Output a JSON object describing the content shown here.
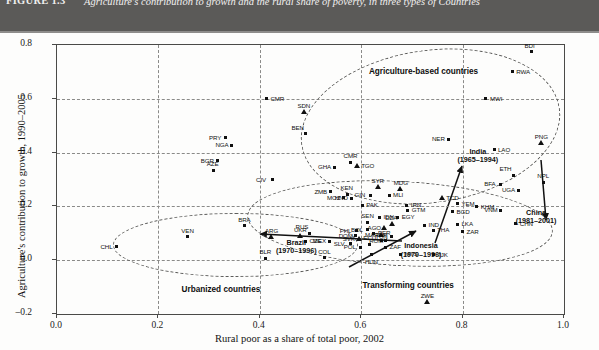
{
  "figure": {
    "number": "FIGURE 1.3",
    "caption": "Agriculture's contribution to growth and the rural share of poverty, in three types of Countries"
  },
  "chart_data": {
    "type": "scatter",
    "title": "Agriculture's contribution to growth and the rural share of poverty, in three types of Countries",
    "xlabel": "Rural poor as a share of total poor, 2002",
    "ylabel": "Agriculture's contribution to growth, 1990–2005",
    "xlim": [
      0.0,
      1.0
    ],
    "ylim": [
      -0.2,
      0.8
    ],
    "xticks": [
      "0.0",
      "0.2",
      "0.4",
      "0.6",
      "0.8",
      "1.0"
    ],
    "yticks": [
      "0.8",
      "0.6",
      "0.4",
      "0.2",
      "0.0",
      "–0.2"
    ],
    "grid": "dashed",
    "legend": "none",
    "points": [
      {
        "label": "BDI",
        "x": 0.935,
        "y": 0.775,
        "marker": "square",
        "lpos": "top"
      },
      {
        "label": "RWA",
        "x": 0.898,
        "y": 0.7,
        "marker": "square",
        "lpos": "right"
      },
      {
        "label": "MWI",
        "x": 0.846,
        "y": 0.6,
        "marker": "square",
        "lpos": "right"
      },
      {
        "label": "CMR",
        "x": 0.413,
        "y": 0.6,
        "marker": "square",
        "lpos": "right"
      },
      {
        "label": "SDN",
        "x": 0.487,
        "y": 0.552,
        "marker": "triangle",
        "lpos": "top"
      },
      {
        "label": "BEN",
        "x": 0.49,
        "y": 0.47,
        "marker": "square",
        "lpos": "topleft"
      },
      {
        "label": "PRY",
        "x": 0.332,
        "y": 0.455,
        "marker": "square",
        "lpos": "left"
      },
      {
        "label": "NGA",
        "x": 0.345,
        "y": 0.428,
        "marker": "square",
        "lpos": "left"
      },
      {
        "label": "NER",
        "x": 0.772,
        "y": 0.45,
        "marker": "square",
        "lpos": "left"
      },
      {
        "label": "PNG",
        "x": 0.955,
        "y": 0.437,
        "marker": "triangle",
        "lpos": "top"
      },
      {
        "label": "LAO",
        "x": 0.862,
        "y": 0.41,
        "marker": "square",
        "lpos": "right"
      },
      {
        "label": "CMR",
        "x": 0.578,
        "y": 0.365,
        "marker": "square",
        "lpos": "top"
      },
      {
        "label": "TGO",
        "x": 0.592,
        "y": 0.35,
        "marker": "triangle",
        "lpos": "right"
      },
      {
        "label": "GHA",
        "x": 0.547,
        "y": 0.345,
        "marker": "square",
        "lpos": "left"
      },
      {
        "label": "BGR",
        "x": 0.316,
        "y": 0.37,
        "marker": "square",
        "lpos": "left"
      },
      {
        "label": "AZE",
        "x": 0.308,
        "y": 0.335,
        "marker": "square",
        "lpos": "top"
      },
      {
        "label": "CIV",
        "x": 0.425,
        "y": 0.3,
        "marker": "square",
        "lpos": "left"
      },
      {
        "label": "ETH",
        "x": 0.9,
        "y": 0.315,
        "marker": "square",
        "lpos": "topleft"
      },
      {
        "label": "NPL",
        "x": 0.96,
        "y": 0.29,
        "marker": "square",
        "lpos": "top"
      },
      {
        "label": "BFA",
        "x": 0.875,
        "y": 0.283,
        "marker": "square",
        "lpos": "left"
      },
      {
        "label": "UGA",
        "x": 0.91,
        "y": 0.26,
        "marker": "square",
        "lpos": "left"
      },
      {
        "label": "SYR",
        "x": 0.633,
        "y": 0.272,
        "marker": "triangle",
        "lpos": "top"
      },
      {
        "label": "MDG",
        "x": 0.677,
        "y": 0.263,
        "marker": "triangle",
        "lpos": "top"
      },
      {
        "label": "ZMB",
        "x": 0.54,
        "y": 0.255,
        "marker": "square",
        "lpos": "left"
      },
      {
        "label": "KEN",
        "x": 0.572,
        "y": 0.245,
        "marker": "square",
        "lpos": "top"
      },
      {
        "label": "MOZ",
        "x": 0.565,
        "y": 0.233,
        "marker": "square",
        "lpos": "left"
      },
      {
        "label": "GIN",
        "x": 0.619,
        "y": 0.242,
        "marker": "square",
        "lpos": "left"
      },
      {
        "label": "MLI",
        "x": 0.655,
        "y": 0.242,
        "marker": "square",
        "lpos": "right"
      },
      {
        "label": "TCD",
        "x": 0.76,
        "y": 0.232,
        "marker": "triangle",
        "lpos": "right"
      },
      {
        "label": "YEM",
        "x": 0.79,
        "y": 0.21,
        "marker": "square",
        "lpos": "right"
      },
      {
        "label": "KHM",
        "x": 0.828,
        "y": 0.198,
        "marker": "square",
        "lpos": "right"
      },
      {
        "label": "VNM",
        "x": 0.875,
        "y": 0.185,
        "marker": "square",
        "lpos": "left"
      },
      {
        "label": "CHN",
        "x": 0.905,
        "y": 0.135,
        "marker": "square",
        "lpos": "right"
      },
      {
        "label": "BGD",
        "x": 0.78,
        "y": 0.18,
        "marker": "square",
        "lpos": "right"
      },
      {
        "label": "LKA",
        "x": 0.79,
        "y": 0.133,
        "marker": "square",
        "lpos": "right"
      },
      {
        "label": "ZAR",
        "x": 0.8,
        "y": 0.105,
        "marker": "square",
        "lpos": "right"
      },
      {
        "label": "PAK",
        "x": 0.602,
        "y": 0.205,
        "marker": "square",
        "lpos": "right"
      },
      {
        "label": "IRN",
        "x": 0.69,
        "y": 0.205,
        "marker": "square",
        "lpos": "right"
      },
      {
        "label": "HND",
        "x": 0.58,
        "y": 0.23,
        "marker": "square",
        "lpos": "left"
      },
      {
        "label": "GTM",
        "x": 0.692,
        "y": 0.185,
        "marker": "square",
        "lpos": "right"
      },
      {
        "label": "IDN",
        "x": 0.636,
        "y": 0.16,
        "marker": "square",
        "lpos": "right"
      },
      {
        "label": "EGY",
        "x": 0.672,
        "y": 0.16,
        "marker": "square",
        "lpos": "right"
      },
      {
        "label": "IND",
        "x": 0.725,
        "y": 0.13,
        "marker": "square",
        "lpos": "right"
      },
      {
        "label": "THA",
        "x": 0.742,
        "y": 0.112,
        "marker": "square",
        "lpos": "right"
      },
      {
        "label": "SEN",
        "x": 0.613,
        "y": 0.142,
        "marker": "square",
        "lpos": "top"
      },
      {
        "label": "DZA",
        "x": 0.66,
        "y": 0.133,
        "marker": "triangle",
        "lpos": "top"
      },
      {
        "label": "AGO",
        "x": 0.645,
        "y": 0.118,
        "marker": "triangle",
        "lpos": "left"
      },
      {
        "label": "MAR",
        "x": 0.64,
        "y": 0.093,
        "marker": "triangle",
        "lpos": "left"
      },
      {
        "label": "TUN",
        "x": 0.66,
        "y": 0.088,
        "marker": "square",
        "lpos": "left"
      },
      {
        "label": "ROM",
        "x": 0.648,
        "y": 0.073,
        "marker": "square",
        "lpos": "left"
      },
      {
        "label": "TJK",
        "x": 0.742,
        "y": 0.02,
        "marker": "square",
        "lpos": "right"
      },
      {
        "label": "ZWE",
        "x": 0.73,
        "y": -0.155,
        "marker": "triangle",
        "lpos": "top"
      },
      {
        "label": "BRA",
        "x": 0.37,
        "y": 0.128,
        "marker": "square",
        "lpos": "top"
      },
      {
        "label": "VEN",
        "x": 0.258,
        "y": 0.088,
        "marker": "square",
        "lpos": "top"
      },
      {
        "label": "CHL",
        "x": 0.118,
        "y": 0.05,
        "marker": "square",
        "lpos": "left"
      },
      {
        "label": "ARG",
        "x": 0.423,
        "y": 0.085,
        "marker": "triangle",
        "lpos": "top"
      },
      {
        "label": "UKR",
        "x": 0.48,
        "y": 0.09,
        "marker": "triangle",
        "lpos": "top"
      },
      {
        "label": "RUS",
        "x": 0.498,
        "y": 0.1,
        "marker": "square",
        "lpos": "topleft"
      },
      {
        "label": "CZE",
        "x": 0.49,
        "y": 0.07,
        "marker": "square",
        "lpos": "right"
      },
      {
        "label": "MEX",
        "x": 0.537,
        "y": 0.07,
        "marker": "square",
        "lpos": "left"
      },
      {
        "label": "COL",
        "x": 0.528,
        "y": 0.01,
        "marker": "square",
        "lpos": "top"
      },
      {
        "label": "BLR",
        "x": 0.412,
        "y": 0.008,
        "marker": "square",
        "lpos": "top"
      },
      {
        "label": "PHL",
        "x": 0.59,
        "y": 0.11,
        "marker": "square",
        "lpos": "left"
      },
      {
        "label": "BOL",
        "x": 0.612,
        "y": 0.113,
        "marker": "square",
        "lpos": "left"
      },
      {
        "label": "PER",
        "x": 0.625,
        "y": 0.1,
        "marker": "square",
        "lpos": "right"
      },
      {
        "label": "DOM",
        "x": 0.588,
        "y": 0.09,
        "marker": "square",
        "lpos": "left"
      },
      {
        "label": "SVK",
        "x": 0.596,
        "y": 0.078,
        "marker": "triangle",
        "lpos": "left"
      },
      {
        "label": "SLV",
        "x": 0.578,
        "y": 0.062,
        "marker": "square",
        "lpos": "left"
      },
      {
        "label": "POL",
        "x": 0.598,
        "y": 0.048,
        "marker": "square",
        "lpos": "left"
      },
      {
        "label": "ECU",
        "x": 0.617,
        "y": 0.06,
        "marker": "square",
        "lpos": "top"
      },
      {
        "label": "TUR",
        "x": 0.64,
        "y": 0.072,
        "marker": "square",
        "lpos": "top"
      },
      {
        "label": "ZAF",
        "x": 0.648,
        "y": 0.048,
        "marker": "square",
        "lpos": "right"
      },
      {
        "label": "HUN",
        "x": 0.62,
        "y": 0.02,
        "marker": "square",
        "lpos": "bottom"
      },
      {
        "label": "MYS",
        "x": 0.678,
        "y": 0.022,
        "marker": "square",
        "lpos": "right"
      }
    ],
    "groups": [
      {
        "label": "Agriculture-based countries"
      },
      {
        "label": "Transforming countries"
      },
      {
        "label": "Urbanized countries"
      }
    ],
    "trajectories": [
      {
        "label_line1": "India",
        "label_line2": "(1965–1994)"
      },
      {
        "label_line1": "China",
        "label_line2": "(1981–2001)"
      },
      {
        "label_line1": "Indonesia",
        "label_line2": "(1970–1996)"
      },
      {
        "label_line1": "Brazil",
        "label_line2": "(1970–1996)"
      }
    ]
  }
}
